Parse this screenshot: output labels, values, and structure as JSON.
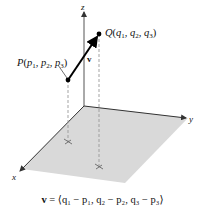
{
  "figure": {
    "axes": {
      "x_label": "x",
      "y_label": "y",
      "z_label": "z"
    },
    "points": {
      "P": {
        "label": "P(p",
        "full": "P(p1, p2, p3)"
      },
      "Q": {
        "label": "Q(q",
        "full": "Q(q1, q2, q3)"
      }
    },
    "vector_label": "v",
    "caption": {
      "vec": "v",
      "text": " = ⟨q₁ − p₁, q₂ − p₂, q₃ − p₃⟩"
    },
    "colors": {
      "plane": "#d9d9d9",
      "axis": "#333333",
      "vector": "#000000",
      "dashed": "#999999"
    }
  }
}
